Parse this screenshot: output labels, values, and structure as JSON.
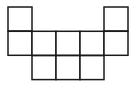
{
  "diagram": {
    "type": "square-net",
    "cell_size": 24,
    "origin": [
      8,
      7
    ],
    "stroke_color": "#1a1a1a",
    "stroke_width": 1.5,
    "fill_color": "#ffffff",
    "cells": [
      {
        "row": 0,
        "col": 0
      },
      {
        "row": 0,
        "col": 4
      },
      {
        "row": 1,
        "col": 0
      },
      {
        "row": 1,
        "col": 1
      },
      {
        "row": 1,
        "col": 2
      },
      {
        "row": 1,
        "col": 3
      },
      {
        "row": 1,
        "col": 4
      },
      {
        "row": 2,
        "col": 1
      },
      {
        "row": 2,
        "col": 2
      },
      {
        "row": 2,
        "col": 3
      }
    ]
  }
}
